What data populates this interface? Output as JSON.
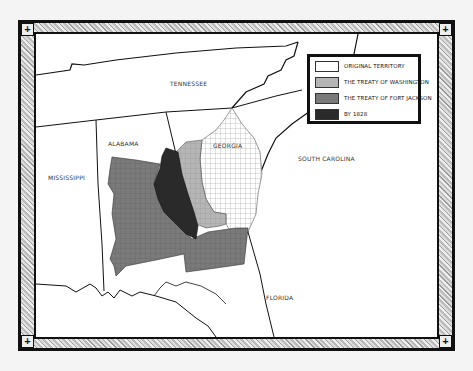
{
  "map": {
    "states": [
      {
        "name": "TENNESSEE",
        "x": 134,
        "y": 46
      },
      {
        "name": "ALABAMA",
        "x": 72,
        "y": 106
      },
      {
        "name": "GEORGIA",
        "x": 177,
        "y": 108
      },
      {
        "name": "SOUTH CAROLINA",
        "x": 282,
        "y": 121
      },
      {
        "name": "MISSISSIPPI",
        "x": 12,
        "y": 140
      },
      {
        "name": "FLORIDA",
        "x": 230,
        "y": 287
      }
    ],
    "legend": {
      "items": [
        {
          "label": "ORIGINAL TERRITORY",
          "fill": "#ffffff",
          "pattern": "grid"
        },
        {
          "label": "THE TREATY OF WASHINGTON",
          "fill": "#b5b5b5",
          "pattern": "grid"
        },
        {
          "label": "THE TREATY OF FORT JACKSON",
          "fill": "#7a7a7a",
          "pattern": "grid"
        },
        {
          "label": "BY 1828",
          "fill": "#2a2a2a",
          "pattern": "solid"
        }
      ]
    },
    "colors": {
      "original": "#ffffff",
      "washington": "#b5b5b5",
      "fort_jackson": "#7a7a7a",
      "by_1828": "#2a2a2a",
      "border": "#111111"
    },
    "corner_glyph": "+"
  }
}
